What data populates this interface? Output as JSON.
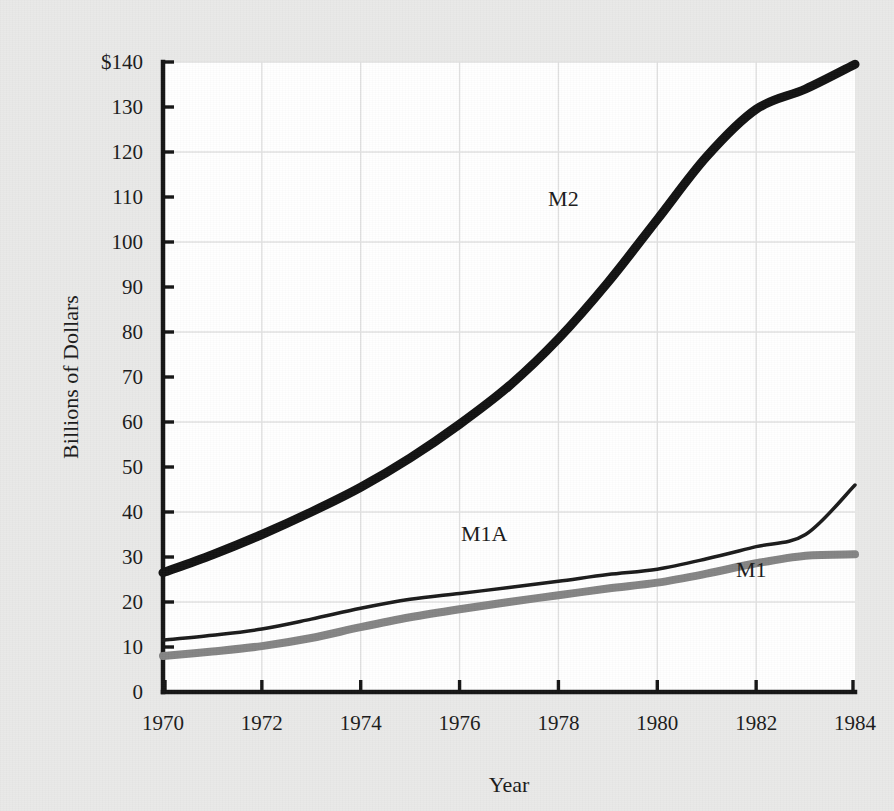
{
  "figure": {
    "background_color": "#e9e9e8",
    "plot_background_color": "#ffffff",
    "axis_color": "#141414",
    "grid_color": "#e2e2e2"
  },
  "chart_data": {
    "type": "line",
    "title": "",
    "xlabel": "Year",
    "ylabel": "Billions of Dollars",
    "xlim": [
      1970,
      1984
    ],
    "ylim": [
      0,
      140
    ],
    "xticks": [
      1970,
      1972,
      1974,
      1976,
      1978,
      1980,
      1982,
      1984
    ],
    "xtick_labels": [
      "1970",
      "1972",
      "1974",
      "1976",
      "1978",
      "1980",
      "1982",
      "1984"
    ],
    "yticks": [
      0,
      10,
      20,
      30,
      40,
      50,
      60,
      70,
      80,
      90,
      100,
      110,
      120,
      130,
      140
    ],
    "ytick_labels": [
      "0",
      "10",
      "20",
      "30",
      "40",
      "50",
      "60",
      "70",
      "80",
      "90",
      "100",
      "110",
      "120",
      "130",
      "$140"
    ],
    "grid": "horizontal gridlines every 20 units; vertical gridlines at every even year",
    "gridline_y_values": [
      20,
      40,
      60,
      80,
      100,
      120,
      140
    ],
    "gridline_x_values": [
      1972,
      1974,
      1976,
      1978,
      1980,
      1982
    ],
    "legend": "inline labels placed next to each curve",
    "x": [
      1970,
      1971,
      1972,
      1973,
      1974,
      1975,
      1976,
      1977,
      1978,
      1979,
      1980,
      1981,
      1982,
      1983,
      1984
    ],
    "series": [
      {
        "name": "M2",
        "label": "M2",
        "color": "#111111",
        "line_width": 9,
        "label_x": 1978.1,
        "label_y": 108,
        "values": [
          26.5,
          30.5,
          35.0,
          40.0,
          45.5,
          52.0,
          59.5,
          68.0,
          78.5,
          91.0,
          105.0,
          119.0,
          129.5,
          134.0,
          139.5
        ]
      },
      {
        "name": "M1A",
        "label": "M1A",
        "color": "#1a1a1a",
        "line_width": 3.5,
        "label_x": 1976.5,
        "label_y": 33.5,
        "values": [
          11.5,
          12.6,
          14.0,
          16.2,
          18.6,
          20.6,
          21.9,
          23.2,
          24.6,
          26.1,
          27.3,
          29.6,
          32.3,
          35.0,
          46.0
        ]
      },
      {
        "name": "M1",
        "label": "M1",
        "color": "#848484",
        "line_width": 8,
        "label_x": 1981.9,
        "label_y": 25.5,
        "values": [
          8.0,
          9.0,
          10.2,
          12.0,
          14.4,
          16.6,
          18.4,
          20.0,
          21.5,
          23.0,
          24.3,
          26.3,
          28.6,
          30.3,
          30.6
        ]
      }
    ]
  }
}
